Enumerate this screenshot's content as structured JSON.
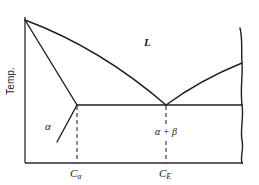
{
  "diagram": {
    "type": "binary eutectic phase diagram",
    "y_axis_label": "Temp.",
    "phase_labels": {
      "liquid": "L",
      "alpha": "α",
      "alpha_beta": "α + β"
    },
    "x_ticks": [
      {
        "symbol": "C",
        "subscript": "α",
        "meaning": "maximum solubility composition of α"
      },
      {
        "symbol": "C",
        "subscript": "E",
        "meaning": "eutectic composition"
      }
    ],
    "features": {
      "eutectic_isotherm": "horizontal line from α vertex through eutectic point to right edge",
      "right_boundary": "wavy break line indicating diagram continues"
    },
    "colors": {
      "line": "#1f1f1f",
      "background": "#ffffff"
    }
  }
}
